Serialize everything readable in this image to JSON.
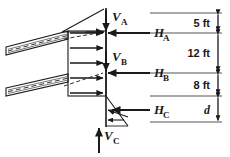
{
  "figure": {
    "type": "structural-free-body-diagram",
    "background_color": "#ffffff",
    "line_color": "#1a1a1a",
    "width": 230,
    "height": 157
  },
  "forces": {
    "vertical": [
      {
        "id": "VA",
        "base": "V",
        "subscript": "A",
        "direction": "down",
        "x": 106,
        "y_from": 10,
        "y_to": 30
      },
      {
        "id": "VB",
        "base": "V",
        "subscript": "B",
        "direction": "down",
        "x": 106,
        "y_from": 50,
        "y_to": 70
      },
      {
        "id": "VC",
        "base": "V",
        "subscript": "C",
        "direction": "up",
        "x": 99,
        "y_from": 152,
        "y_to": 126
      }
    ],
    "horizontal": [
      {
        "id": "HA",
        "base": "H",
        "subscript": "A",
        "direction": "left",
        "y": 33,
        "x_from": 150,
        "x_to": 106
      },
      {
        "id": "HB",
        "base": "H",
        "subscript": "B",
        "direction": "left",
        "y": 73,
        "x_from": 150,
        "x_to": 106
      },
      {
        "id": "HC",
        "base": "H",
        "subscript": "C",
        "direction": "left",
        "y": 110,
        "x_from": 150,
        "x_to": 106
      }
    ]
  },
  "dimensions": [
    {
      "id": "dim-5ft",
      "label": "5 ft",
      "italic": false,
      "y_top": 13,
      "y_bottom": 33
    },
    {
      "id": "dim-12ft",
      "label": "12 ft",
      "italic": false,
      "y_top": 33,
      "y_bottom": 73
    },
    {
      "id": "dim-8ft",
      "label": "8 ft",
      "italic": false,
      "y_top": 73,
      "y_bottom": 96
    },
    {
      "id": "dim-d",
      "label": "d",
      "italic": true,
      "y_top": 96,
      "y_bottom": 122
    }
  ],
  "extension_lines": [
    {
      "id": "ext-top",
      "y": 13
    },
    {
      "id": "ext-a",
      "y": 33
    },
    {
      "id": "ext-b",
      "y": 73
    },
    {
      "id": "ext-c",
      "y": 96
    },
    {
      "id": "ext-bottom",
      "y": 122
    }
  ],
  "members": [
    {
      "id": "upper-beam",
      "name": "upper-strut",
      "x1": 6,
      "y1": 52,
      "x2": 70,
      "y2": 36
    },
    {
      "id": "lower-beam",
      "name": "lower-strut",
      "x1": 6,
      "y1": 92,
      "x2": 70,
      "y2": 78
    }
  ],
  "pressure_diagram": {
    "box": {
      "x": 68,
      "y": 31,
      "width": 38,
      "height": 65
    },
    "arrow_count": 5,
    "top_wedge": {
      "apex_x": 62,
      "apex_y": 31,
      "tip_x": 106,
      "tip_y": 8
    },
    "bottom_wedge": {
      "apex_x": 106,
      "apex_y": 96,
      "tip_x": 106,
      "tip_y": 126
    }
  }
}
